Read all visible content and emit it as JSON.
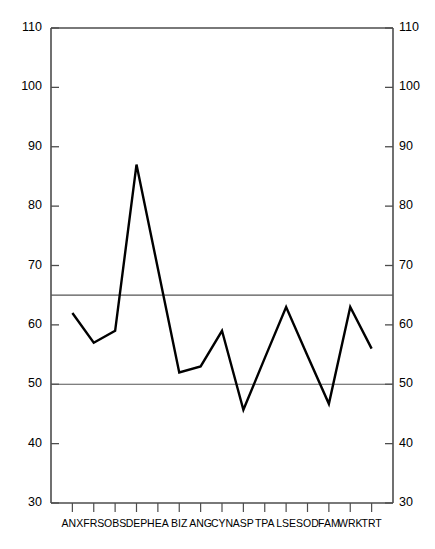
{
  "chart_data": {
    "type": "line",
    "title": "",
    "subtitle": "",
    "xlabel": "",
    "ylabel": "",
    "ylim": [
      30,
      110
    ],
    "y_ticks": [
      30,
      40,
      50,
      60,
      70,
      80,
      90,
      100,
      110
    ],
    "grid": false,
    "legend": "none",
    "dual_y_axis": true,
    "reference_lines": [
      {
        "name": "upper-reference-line",
        "value": 65,
        "color": "#555555"
      },
      {
        "name": "lower-reference-line",
        "value": 50,
        "color": "#555555"
      }
    ],
    "categories": [
      "ANX",
      "FRS",
      "OBS",
      "DEP",
      "HEA",
      "BIZ",
      "ANG",
      "CYN",
      "ASP",
      "TPA",
      "LSE",
      "SOD",
      "FAM",
      "WRK",
      "TRT"
    ],
    "values": [
      62,
      57,
      59,
      87,
      69.5,
      52,
      53,
      59,
      45.7,
      54.4,
      63,
      54.8,
      46.7,
      63,
      56
    ],
    "series": [
      {
        "name": "profile",
        "color": "#000000",
        "values": [
          62,
          57,
          59,
          87,
          69.5,
          52,
          53,
          59,
          45.7,
          54.4,
          63,
          54.8,
          46.7,
          63,
          56
        ]
      }
    ],
    "line_color": "#000000",
    "axis_color": "#4d4d4d",
    "background_color": "#ffffff"
  },
  "axis": {
    "left_labels": [
      "110",
      "100",
      "90",
      "80",
      "70",
      "60",
      "50",
      "40",
      "30"
    ],
    "right_labels": [
      "110",
      "100",
      "90",
      "80",
      "70",
      "60",
      "50",
      "40",
      "30"
    ]
  },
  "xaxis": {
    "labels": [
      "ANX",
      "FRS",
      "OBS",
      "DEP",
      "HEA",
      "BIZ",
      "ANG",
      "CYN",
      "ASP",
      "TPA",
      "LSE",
      "SOD",
      "FAM",
      "WRK",
      "TRT"
    ]
  }
}
